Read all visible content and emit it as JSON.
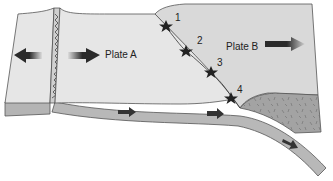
{
  "diagram": {
    "plates": [
      {
        "id": "A",
        "label": "Plate A"
      },
      {
        "id": "B",
        "label": "Plate B"
      }
    ],
    "earthquake_foci": [
      {
        "number": "1"
      },
      {
        "number": "2"
      },
      {
        "number": "3"
      },
      {
        "number": "4"
      }
    ],
    "colors": {
      "surface": "#e6e6e6",
      "plate_b_surface": "#d9d9d9",
      "edge": "#b4b4b4",
      "outline": "#555555",
      "crust": "#9a9a9a",
      "arrow": "#333333"
    }
  }
}
